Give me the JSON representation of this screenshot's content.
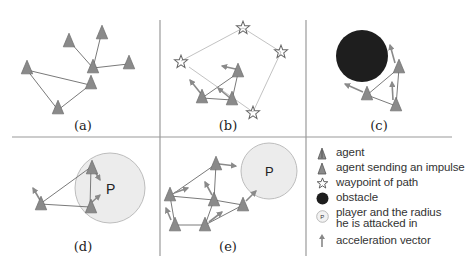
{
  "figure": {
    "panels": [
      {
        "id": "a",
        "caption": "(a)"
      },
      {
        "id": "b",
        "caption": "(b)"
      },
      {
        "id": "c",
        "caption": "(c)"
      },
      {
        "id": "d",
        "caption": "(d)",
        "player_label": "P"
      },
      {
        "id": "e",
        "caption": "(e)",
        "player_label": "P"
      }
    ],
    "legend": [
      {
        "icon": "agent-icon",
        "label": "agent"
      },
      {
        "icon": "agent-impulse-icon",
        "label": "agent sending an impulse"
      },
      {
        "icon": "waypoint-star-icon",
        "label": "waypoint of path"
      },
      {
        "icon": "obstacle-icon",
        "label": "obstacle"
      },
      {
        "icon": "player-radius-icon",
        "label": "player and the radius\nhe is attacked in",
        "icon_text": "P"
      },
      {
        "icon": "acceleration-vector-icon",
        "label": "acceleration vector"
      }
    ]
  },
  "colors": {
    "agent": "#8a8a8a",
    "link": "#7a7a7a",
    "path": "#bbbbbb",
    "obstacle": "#1e1e1e",
    "player_fill": "#ececec",
    "player_stroke": "#bdbdbd",
    "divider": "#9a9a9a"
  }
}
